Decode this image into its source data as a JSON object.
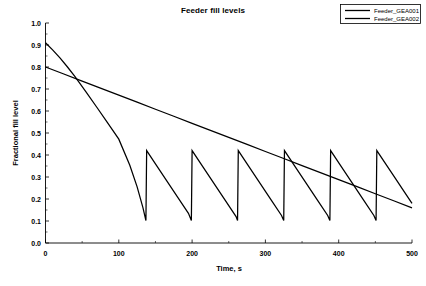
{
  "chart_data": {
    "type": "line",
    "title": "Feeder fill levels",
    "xlabel": "Time, s",
    "ylabel": "Fractional fill level",
    "xlim": [
      0,
      500
    ],
    "ylim": [
      0.0,
      1.0
    ],
    "xticks": [
      0,
      100,
      200,
      300,
      400,
      500
    ],
    "xtick_labels": [
      "0",
      "100",
      "200",
      "300",
      "400",
      "500"
    ],
    "xminor_step": 50,
    "yticks": [
      0.0,
      0.1,
      0.2,
      0.3,
      0.4,
      0.5,
      0.6,
      0.7,
      0.8,
      0.9,
      1.0
    ],
    "ytick_labels": [
      "0.0",
      "0.1",
      "0.2",
      "0.3",
      "0.4",
      "0.5",
      "0.6",
      "0.7",
      "0.8",
      "0.9",
      "1.0"
    ],
    "yminor_step": 0.05,
    "grid": false,
    "legend_position": "top-right",
    "line_color": "#000000",
    "series": [
      {
        "name": "Feeder_GEA001",
        "color": "#000000",
        "points": [
          [
            0,
            0.8
          ],
          [
            25,
            0.768
          ],
          [
            50,
            0.736
          ],
          [
            75,
            0.704
          ],
          [
            100,
            0.672
          ],
          [
            125,
            0.64
          ],
          [
            150,
            0.608
          ],
          [
            175,
            0.576
          ],
          [
            200,
            0.544
          ],
          [
            225,
            0.512
          ],
          [
            250,
            0.48
          ],
          [
            275,
            0.448
          ],
          [
            300,
            0.416
          ],
          [
            325,
            0.384
          ],
          [
            350,
            0.352
          ],
          [
            375,
            0.32
          ],
          [
            400,
            0.288
          ],
          [
            425,
            0.256
          ],
          [
            450,
            0.224
          ],
          [
            475,
            0.192
          ],
          [
            500,
            0.16
          ]
        ]
      },
      {
        "name": "Feeder_GEA002",
        "color": "#000000",
        "points": [
          [
            0,
            0.91
          ],
          [
            10,
            0.877
          ],
          [
            20,
            0.84
          ],
          [
            30,
            0.8
          ],
          [
            40,
            0.757
          ],
          [
            55,
            0.688
          ],
          [
            70,
            0.617
          ],
          [
            85,
            0.545
          ],
          [
            100,
            0.472
          ],
          [
            115,
            0.353
          ],
          [
            125,
            0.255
          ],
          [
            133,
            0.16
          ],
          [
            137,
            0.102
          ],
          [
            138,
            0.42
          ],
          [
            150,
            0.36
          ],
          [
            165,
            0.285
          ],
          [
            180,
            0.21
          ],
          [
            195,
            0.135
          ],
          [
            199,
            0.102
          ],
          [
            200,
            0.42
          ],
          [
            215,
            0.345
          ],
          [
            230,
            0.27
          ],
          [
            245,
            0.195
          ],
          [
            260,
            0.12
          ],
          [
            262,
            0.102
          ],
          [
            263,
            0.42
          ],
          [
            278,
            0.345
          ],
          [
            293,
            0.27
          ],
          [
            308,
            0.195
          ],
          [
            322,
            0.125
          ],
          [
            325,
            0.102
          ],
          [
            326,
            0.42
          ],
          [
            341,
            0.345
          ],
          [
            356,
            0.27
          ],
          [
            371,
            0.195
          ],
          [
            385,
            0.125
          ],
          [
            388,
            0.102
          ],
          [
            389,
            0.42
          ],
          [
            404,
            0.345
          ],
          [
            419,
            0.27
          ],
          [
            434,
            0.195
          ],
          [
            448,
            0.125
          ],
          [
            451,
            0.102
          ],
          [
            452,
            0.42
          ],
          [
            465,
            0.355
          ],
          [
            478,
            0.29
          ],
          [
            490,
            0.23
          ],
          [
            500,
            0.18
          ]
        ]
      }
    ]
  },
  "legend": {
    "entries": [
      {
        "label": "Feeder_GEA001"
      },
      {
        "label": "Feeder_GEA002"
      }
    ]
  }
}
